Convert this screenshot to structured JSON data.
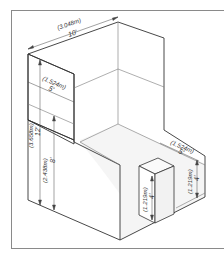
{
  "diagram": {
    "colors": {
      "line": "#333333",
      "thin_line": "#777777",
      "frame": "#8a8a8a",
      "floor": "#f4f4f4",
      "background": "#ffffff"
    },
    "dimensions": {
      "back_width": {
        "metric": "(3.048m)",
        "imperial": "10'"
      },
      "header_drop": {
        "metric": "(1.524m)",
        "imperial": "5'"
      },
      "total_height": {
        "metric": "(3.658m)",
        "imperial": "12'"
      },
      "wall_height": {
        "metric": "(2.438m)",
        "imperial": "8'"
      },
      "side_wall_depth": {
        "metric": "(1.524m)",
        "imperial": "5'"
      },
      "side_wall_height": {
        "metric": "(1.219m)",
        "imperial": "4'"
      },
      "pedestal_height": {
        "metric": "(1.219m)",
        "imperial": "4'"
      }
    }
  }
}
